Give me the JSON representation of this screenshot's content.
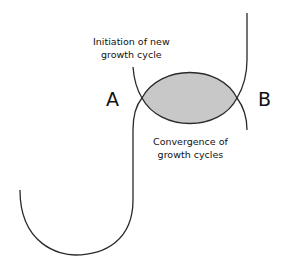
{
  "diagram": {
    "labels": {
      "point_a": "A",
      "point_b": "B",
      "initiation_line1": "Initiation of new",
      "initiation_line2": "growth cycle",
      "convergence_line1": "Convergence of",
      "convergence_line2": "growth cycles"
    },
    "colors": {
      "stroke": "#2a2a2a",
      "overlap_fill": "#c8c8c8",
      "background": "#ffffff"
    }
  }
}
